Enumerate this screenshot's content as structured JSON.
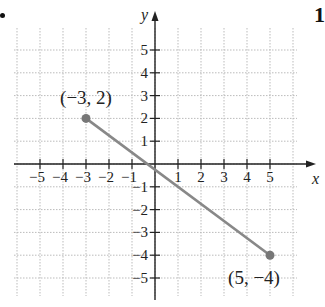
{
  "chart_data": {
    "type": "line",
    "title": "",
    "xlabel": "x",
    "ylabel": "y",
    "xlim": [
      -5.8,
      6.3
    ],
    "ylim": [
      -5.8,
      6.6
    ],
    "grid": true,
    "x_ticks": [
      -5,
      -4,
      -3,
      -2,
      -1,
      1,
      2,
      3,
      4,
      5
    ],
    "y_ticks": [
      -5,
      -4,
      -3,
      -2,
      -1,
      1,
      2,
      3,
      4,
      5
    ],
    "x_tick_labels": [
      "−5",
      "−4",
      "−3",
      "−2",
      "−1",
      "1",
      "2",
      "3",
      "4",
      "5"
    ],
    "y_tick_labels": [
      "−5",
      "−4",
      "−3",
      "−2",
      "−1",
      "1",
      "2",
      "3",
      "4",
      "5"
    ],
    "series": [
      {
        "name": "segment",
        "x": [
          -3,
          5
        ],
        "y": [
          2,
          -4
        ],
        "color": "#888888"
      }
    ],
    "annotations": [
      {
        "text": "(−3, 2)",
        "x": -3,
        "y": 2
      },
      {
        "text": "(5, −4)",
        "x": 5,
        "y": -4
      }
    ]
  },
  "page": {
    "bullet": "•",
    "problem_number": "1"
  },
  "colors": {
    "axis": "#222222",
    "grid": "#bbbbbb",
    "segment": "#888888",
    "point": "#777777"
  }
}
